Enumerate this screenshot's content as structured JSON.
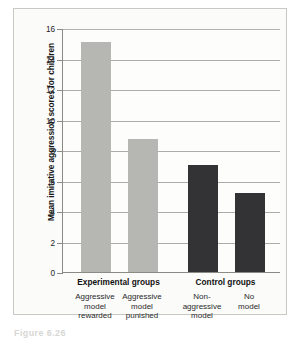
{
  "figure": {
    "caption": "Figure 6.26",
    "panel_background": "#fbfbfa",
    "frame_color": "#c9c9c4"
  },
  "chart_data": {
    "type": "bar",
    "title": "",
    "xlabel": "",
    "ylabel": "Mean imitative aggression scores for children",
    "categories": [
      "Aggressive model rewarded",
      "Aggressive model punished",
      "Non-aggressive model",
      "No model"
    ],
    "values": [
      15.1,
      8.7,
      7.0,
      5.15
    ],
    "ylim": [
      0,
      16
    ],
    "yticks": [
      0,
      2,
      4,
      6,
      8,
      10,
      12,
      14,
      16
    ],
    "ytick_labels": [
      "0",
      "2",
      "4",
      "6",
      "8",
      "10",
      "12",
      "14",
      "16"
    ],
    "grid": true,
    "legend": "none",
    "bar_colors": [
      "#b6b6b3",
      "#b6b6b3",
      "#333335",
      "#333335"
    ],
    "groups": [
      {
        "label": "Experimental groups",
        "categories": [
          {
            "lines": [
              "Aggressive",
              "model",
              "rewarded"
            ]
          },
          {
            "lines": [
              "Aggressive",
              "model",
              "punished"
            ]
          }
        ]
      },
      {
        "label": "Control groups",
        "categories": [
          {
            "lines": [
              "Non-",
              "aggressive",
              "model"
            ]
          },
          {
            "lines": [
              "No",
              "model"
            ]
          }
        ]
      }
    ]
  }
}
